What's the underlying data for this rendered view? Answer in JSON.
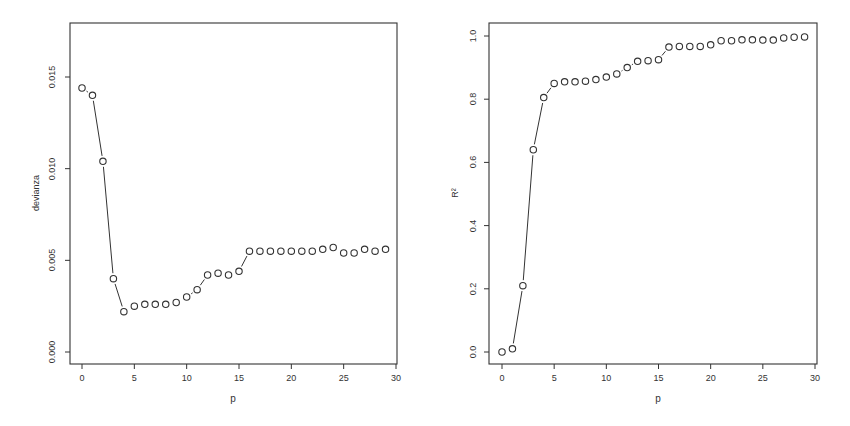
{
  "chart_data": [
    {
      "type": "line",
      "style": "points-and-lines (open circles)",
      "title": "",
      "xlabel": "p",
      "ylabel": "devianza",
      "xlim": [
        0,
        30
      ],
      "ylim": [
        0.0,
        0.017
      ],
      "xticks": [
        0,
        5,
        10,
        15,
        20,
        25,
        30
      ],
      "xtick_labels": [
        "0",
        "5",
        "10",
        "15",
        "20",
        "25",
        "30"
      ],
      "yticks": [
        0.0,
        0.005,
        0.01,
        0.015
      ],
      "ytick_labels": [
        "0.000",
        "0.005",
        "0.010",
        "0.015"
      ],
      "grid": false,
      "x": [
        0,
        1,
        2,
        3,
        4,
        5,
        6,
        7,
        8,
        9,
        10,
        11,
        12,
        13,
        14,
        15,
        16,
        17,
        18,
        19,
        20,
        21,
        22,
        23,
        24,
        25,
        26,
        27,
        28,
        29
      ],
      "y": [
        0.0144,
        0.014,
        0.0104,
        0.004,
        0.0022,
        0.0025,
        0.0026,
        0.0026,
        0.0026,
        0.0027,
        0.003,
        0.0034,
        0.0042,
        0.0043,
        0.0042,
        0.0044,
        0.0055,
        0.0055,
        0.0055,
        0.0055,
        0.0055,
        0.0055,
        0.0055,
        0.0056,
        0.0057,
        0.0054,
        0.0054,
        0.0056,
        0.0055,
        0.0056
      ]
    },
    {
      "type": "line",
      "style": "points-and-lines (open circles)",
      "title": "",
      "xlabel": "p",
      "ylabel": "R²",
      "xlim": [
        0,
        30
      ],
      "ylim": [
        0.0,
        1.0
      ],
      "xticks": [
        0,
        5,
        10,
        15,
        20,
        25,
        30
      ],
      "xtick_labels": [
        "0",
        "5",
        "10",
        "15",
        "20",
        "25",
        "30"
      ],
      "yticks": [
        0.0,
        0.2,
        0.4,
        0.6,
        0.8,
        1.0
      ],
      "ytick_labels": [
        "0.0",
        "0.2",
        "0.4",
        "0.6",
        "0.8",
        "1.0"
      ],
      "grid": false,
      "x": [
        0,
        1,
        2,
        3,
        4,
        5,
        6,
        7,
        8,
        9,
        10,
        11,
        12,
        13,
        14,
        15,
        16,
        17,
        18,
        19,
        20,
        21,
        22,
        23,
        24,
        25,
        26,
        27,
        28,
        29
      ],
      "y": [
        0.0,
        0.01,
        0.21,
        0.64,
        0.805,
        0.85,
        0.855,
        0.855,
        0.857,
        0.862,
        0.87,
        0.88,
        0.9,
        0.92,
        0.922,
        0.925,
        0.965,
        0.967,
        0.967,
        0.967,
        0.972,
        0.985,
        0.985,
        0.988,
        0.988,
        0.987,
        0.987,
        0.994,
        0.996,
        0.997
      ]
    }
  ],
  "panels": {
    "left": {
      "ylabel": "devianza",
      "xlabel": "p"
    },
    "right": {
      "ylabel": "R²",
      "xlabel": "p"
    }
  },
  "colors": {
    "ink": "#333333",
    "background": "#ffffff"
  }
}
